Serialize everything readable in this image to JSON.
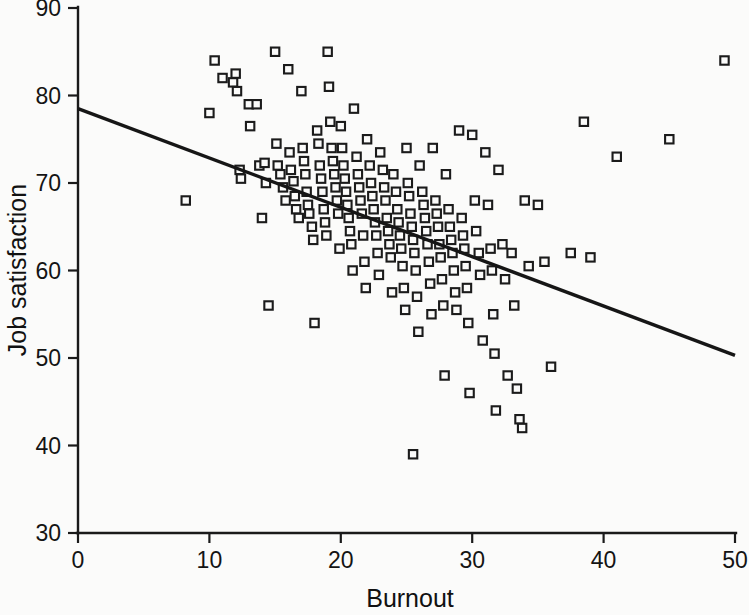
{
  "chart_data": {
    "type": "scatter",
    "title": "",
    "xlabel": "Burnout",
    "ylabel": "Job satisfaction",
    "xlim": [
      0,
      50
    ],
    "ylim": [
      30,
      90
    ],
    "xticks": [
      0,
      10,
      20,
      30,
      40,
      50
    ],
    "yticks": [
      30,
      40,
      50,
      60,
      70,
      80,
      90
    ],
    "grid": false,
    "legend": false,
    "marker": "open-square",
    "marker_color": "#1b1b1b",
    "background_color": "#fbfbfa",
    "trendline": {
      "type": "linear-regression",
      "x": [
        0,
        50
      ],
      "y": [
        78.5,
        50.3
      ],
      "slope": -0.564,
      "intercept": 78.5,
      "color": "#161616"
    },
    "points": [
      [
        8.2,
        68.0
      ],
      [
        10.0,
        78.0
      ],
      [
        10.4,
        84.0
      ],
      [
        11.0,
        82.0
      ],
      [
        11.8,
        81.5
      ],
      [
        12.0,
        82.5
      ],
      [
        12.1,
        80.5
      ],
      [
        12.3,
        71.5
      ],
      [
        12.4,
        70.5
      ],
      [
        13.0,
        79.0
      ],
      [
        13.1,
        76.5
      ],
      [
        13.6,
        79.0
      ],
      [
        13.8,
        72.0
      ],
      [
        14.0,
        66.0
      ],
      [
        14.2,
        72.3
      ],
      [
        14.3,
        70.0
      ],
      [
        14.5,
        56.0
      ],
      [
        15.0,
        85.0
      ],
      [
        15.1,
        74.5
      ],
      [
        15.2,
        72.0
      ],
      [
        15.4,
        71.0
      ],
      [
        15.6,
        69.5
      ],
      [
        15.8,
        68.0
      ],
      [
        16.0,
        83.0
      ],
      [
        16.1,
        73.5
      ],
      [
        16.2,
        71.5
      ],
      [
        16.4,
        70.2
      ],
      [
        16.5,
        68.5
      ],
      [
        16.6,
        67.0
      ],
      [
        16.8,
        66.0
      ],
      [
        17.0,
        80.5
      ],
      [
        17.1,
        74.0
      ],
      [
        17.2,
        72.5
      ],
      [
        17.3,
        71.0
      ],
      [
        17.4,
        69.0
      ],
      [
        17.5,
        67.5
      ],
      [
        17.6,
        66.5
      ],
      [
        17.8,
        65.0
      ],
      [
        17.9,
        63.5
      ],
      [
        18.0,
        54.0
      ],
      [
        18.2,
        76.0
      ],
      [
        18.3,
        74.5
      ],
      [
        18.4,
        72.0
      ],
      [
        18.5,
        70.5
      ],
      [
        18.6,
        69.0
      ],
      [
        18.7,
        67.0
      ],
      [
        18.8,
        65.5
      ],
      [
        18.9,
        64.0
      ],
      [
        19.0,
        85.0
      ],
      [
        19.1,
        81.0
      ],
      [
        19.2,
        77.0
      ],
      [
        19.3,
        74.0
      ],
      [
        19.4,
        72.5
      ],
      [
        19.5,
        71.0
      ],
      [
        19.6,
        69.5
      ],
      [
        19.7,
        68.0
      ],
      [
        19.8,
        66.5
      ],
      [
        19.9,
        62.5
      ],
      [
        20.0,
        76.5
      ],
      [
        20.1,
        74.0
      ],
      [
        20.2,
        72.0
      ],
      [
        20.3,
        70.5
      ],
      [
        20.4,
        69.0
      ],
      [
        20.5,
        67.5
      ],
      [
        20.6,
        66.0
      ],
      [
        20.7,
        64.5
      ],
      [
        20.8,
        63.0
      ],
      [
        20.9,
        60.0
      ],
      [
        21.0,
        78.5
      ],
      [
        21.2,
        73.0
      ],
      [
        21.3,
        71.0
      ],
      [
        21.4,
        69.5
      ],
      [
        21.5,
        68.0
      ],
      [
        21.6,
        66.5
      ],
      [
        21.7,
        64.0
      ],
      [
        21.8,
        61.0
      ],
      [
        21.9,
        58.0
      ],
      [
        22.0,
        75.0
      ],
      [
        22.2,
        72.0
      ],
      [
        22.3,
        70.0
      ],
      [
        22.4,
        68.5
      ],
      [
        22.5,
        67.0
      ],
      [
        22.6,
        65.5
      ],
      [
        22.7,
        64.0
      ],
      [
        22.8,
        62.0
      ],
      [
        22.9,
        59.5
      ],
      [
        23.0,
        73.5
      ],
      [
        23.2,
        71.5
      ],
      [
        23.3,
        69.5
      ],
      [
        23.4,
        68.0
      ],
      [
        23.5,
        66.0
      ],
      [
        23.6,
        64.5
      ],
      [
        23.7,
        63.0
      ],
      [
        23.8,
        61.5
      ],
      [
        23.9,
        57.5
      ],
      [
        24.0,
        71.0
      ],
      [
        24.2,
        69.0
      ],
      [
        24.3,
        67.0
      ],
      [
        24.4,
        65.5
      ],
      [
        24.5,
        64.0
      ],
      [
        24.6,
        62.5
      ],
      [
        24.7,
        60.5
      ],
      [
        24.8,
        58.0
      ],
      [
        24.9,
        55.5
      ],
      [
        25.0,
        74.0
      ],
      [
        25.1,
        70.0
      ],
      [
        25.2,
        68.5
      ],
      [
        25.3,
        66.5
      ],
      [
        25.4,
        65.0
      ],
      [
        25.5,
        63.5
      ],
      [
        25.6,
        62.0
      ],
      [
        25.7,
        60.0
      ],
      [
        25.8,
        57.0
      ],
      [
        25.9,
        53.0
      ],
      [
        25.5,
        39.0
      ],
      [
        26.0,
        72.0
      ],
      [
        26.2,
        69.0
      ],
      [
        26.3,
        67.5
      ],
      [
        26.4,
        66.0
      ],
      [
        26.5,
        64.5
      ],
      [
        26.6,
        63.0
      ],
      [
        26.7,
        61.0
      ],
      [
        26.8,
        58.5
      ],
      [
        26.9,
        55.0
      ],
      [
        27.0,
        74.0
      ],
      [
        27.2,
        68.0
      ],
      [
        27.3,
        66.5
      ],
      [
        27.4,
        65.0
      ],
      [
        27.5,
        63.0
      ],
      [
        27.6,
        61.5
      ],
      [
        27.7,
        59.0
      ],
      [
        27.8,
        56.0
      ],
      [
        27.9,
        48.0
      ],
      [
        28.0,
        71.0
      ],
      [
        28.2,
        67.0
      ],
      [
        28.3,
        65.0
      ],
      [
        28.4,
        63.5
      ],
      [
        28.5,
        62.0
      ],
      [
        28.6,
        60.0
      ],
      [
        28.7,
        57.5
      ],
      [
        28.8,
        55.5
      ],
      [
        29.0,
        76.0
      ],
      [
        29.2,
        66.0
      ],
      [
        29.3,
        64.0
      ],
      [
        29.4,
        62.5
      ],
      [
        29.5,
        60.5
      ],
      [
        29.6,
        58.0
      ],
      [
        29.7,
        54.0
      ],
      [
        29.8,
        46.0
      ],
      [
        30.0,
        75.5
      ],
      [
        30.2,
        68.0
      ],
      [
        30.3,
        64.5
      ],
      [
        30.5,
        62.0
      ],
      [
        30.6,
        59.5
      ],
      [
        30.8,
        52.0
      ],
      [
        31.0,
        73.5
      ],
      [
        31.2,
        67.5
      ],
      [
        31.4,
        62.5
      ],
      [
        31.5,
        60.0
      ],
      [
        31.6,
        55.0
      ],
      [
        31.7,
        50.5
      ],
      [
        31.8,
        44.0
      ],
      [
        32.0,
        71.5
      ],
      [
        32.3,
        63.0
      ],
      [
        32.5,
        59.0
      ],
      [
        32.7,
        48.0
      ],
      [
        33.0,
        62.0
      ],
      [
        33.2,
        56.0
      ],
      [
        33.4,
        46.5
      ],
      [
        33.6,
        43.0
      ],
      [
        33.8,
        42.0
      ],
      [
        34.0,
        68.0
      ],
      [
        34.3,
        60.5
      ],
      [
        35.0,
        67.5
      ],
      [
        35.5,
        61.0
      ],
      [
        36.0,
        49.0
      ],
      [
        37.5,
        62.0
      ],
      [
        38.5,
        77.0
      ],
      [
        39.0,
        61.5
      ],
      [
        41.0,
        73.0
      ],
      [
        45.0,
        75.0
      ],
      [
        49.2,
        84.0
      ]
    ]
  },
  "axes": {
    "y_title": "Job satisfaction",
    "x_title": "Burnout"
  }
}
